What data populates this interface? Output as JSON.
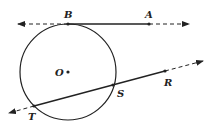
{
  "diagram": {
    "title": "",
    "circle": {
      "center_label": "O",
      "cx": 68,
      "cy": 72,
      "r": 48
    },
    "points": {
      "B": {
        "label": "B",
        "x": 68,
        "y": 24
      },
      "A": {
        "label": "A",
        "x": 149,
        "y": 24
      },
      "O": {
        "label": "O",
        "x": 68,
        "y": 72
      },
      "S": {
        "label": "S",
        "x": 113,
        "y": 85
      },
      "R": {
        "label": "R",
        "x": 165,
        "y": 71
      },
      "T": {
        "label": "T",
        "x": 34,
        "y": 106
      }
    },
    "lines": [
      {
        "name": "tangent-line-BA",
        "description": "Tangent line through B and A"
      },
      {
        "name": "secant-line-TR",
        "description": "Secant line through T, S and R"
      }
    ],
    "colors": {
      "stroke": "#222222",
      "background": "#ffffff"
    }
  }
}
